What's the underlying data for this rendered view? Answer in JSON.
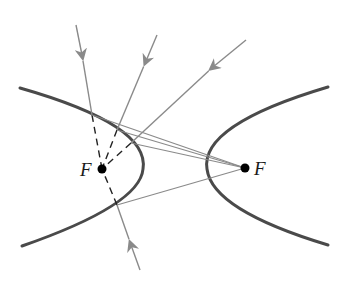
{
  "diagram": {
    "foci": [
      {
        "label": "F",
        "x": 102,
        "y": 169,
        "label_x": 80,
        "label_y": 160
      },
      {
        "label": "F",
        "x": 245,
        "y": 168,
        "label_x": 254,
        "label_y": 159
      }
    ],
    "branches": [
      {
        "name": "left",
        "path": "M20,88 Q150,125 143,169 Q140,205 22,246"
      },
      {
        "name": "right",
        "path": "M328,87 Q200,125 207,169 Q212,210 328,245"
      }
    ],
    "incoming_rays": [
      {
        "from": [
          76,
          25
        ],
        "to": [
          92,
          115
        ],
        "arrow": [
          82,
          55
        ]
      },
      {
        "from": [
          157,
          35
        ],
        "to": [
          117,
          130
        ],
        "arrow": [
          146,
          61
        ]
      },
      {
        "from": [
          246,
          40
        ],
        "to": [
          131,
          143
        ],
        "arrow": [
          213,
          67
        ]
      },
      {
        "from": [
          140,
          270
        ],
        "to": [
          117,
          205
        ],
        "arrow": [
          131,
          245
        ]
      }
    ],
    "reflected_to_focus": [
      [
        92,
        115
      ],
      [
        117,
        130
      ],
      [
        131,
        143
      ],
      [
        117,
        205
      ]
    ],
    "colors": {
      "curve": "#4a4a4a",
      "ray": "#8a8a8a",
      "dashed": "#222222",
      "focus": "#000000"
    }
  }
}
